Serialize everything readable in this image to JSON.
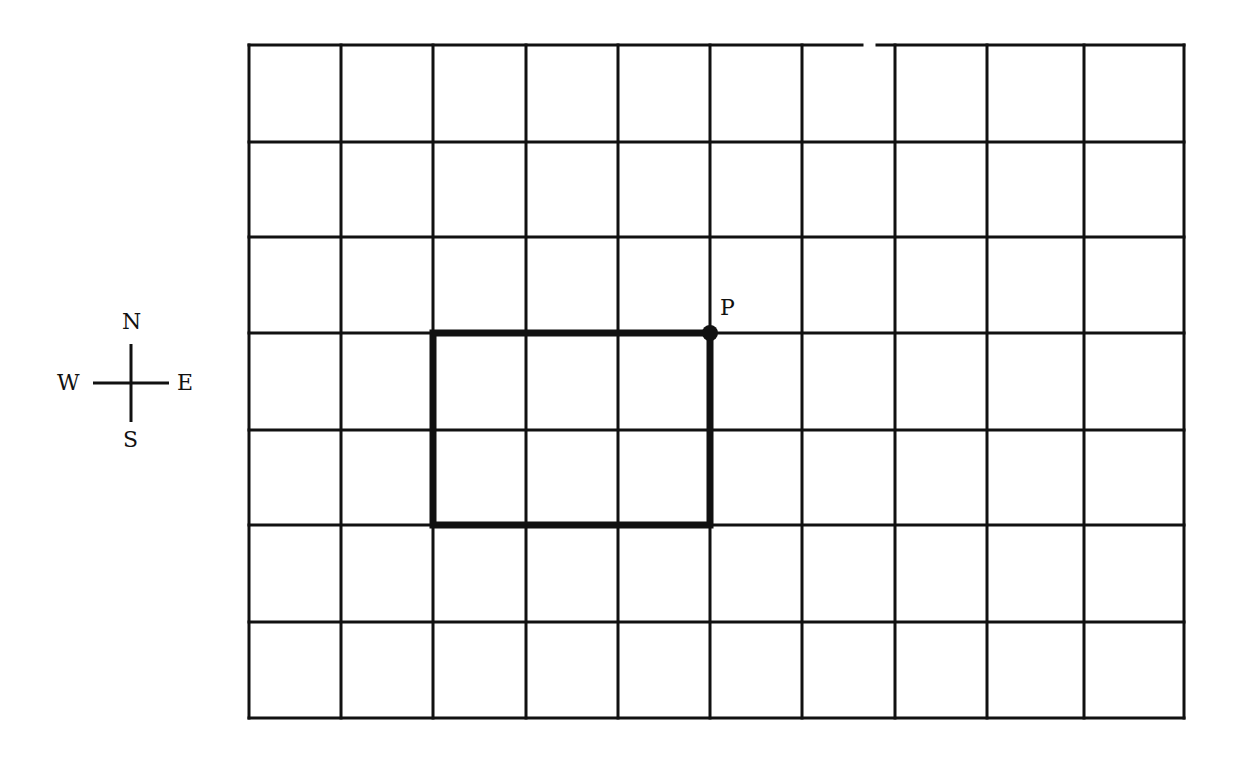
{
  "grid": {
    "columns": 10,
    "rows": 7,
    "x_lines": [
      249,
      341,
      433,
      526,
      618,
      710,
      802,
      895,
      987,
      1084,
      1184
    ],
    "y_lines": [
      45,
      142,
      237,
      333,
      430,
      525,
      622,
      718
    ],
    "line_color": "#111111",
    "top_border_gap": [
      862,
      877
    ]
  },
  "path": {
    "description": "Rectangle traced along grid lines",
    "corners": [
      [
        433,
        333
      ],
      [
        710,
        333
      ],
      [
        710,
        525
      ],
      [
        433,
        525
      ]
    ],
    "grid_corners": [
      [
        2,
        3
      ],
      [
        5,
        3
      ],
      [
        5,
        5
      ],
      [
        2,
        5
      ]
    ],
    "width_squares": 3,
    "height_squares": 2,
    "stroke_color": "#111111"
  },
  "point": {
    "label": "P",
    "x": 710,
    "y": 333,
    "grid_x": 5,
    "grid_y": 3
  },
  "compass": {
    "north": "N",
    "south": "S",
    "east": "E",
    "west": "W",
    "center_x": 131,
    "center_y": 383
  }
}
